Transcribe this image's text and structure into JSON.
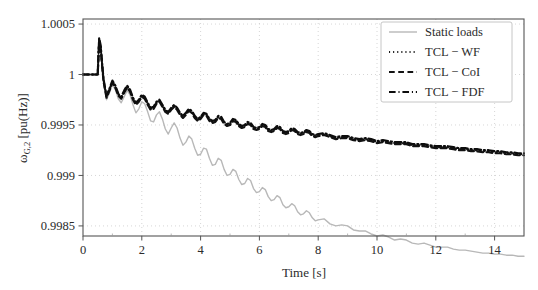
{
  "chart_data": {
    "type": "line",
    "title": "",
    "xlabel": "Time [s]",
    "ylabel": "ω_{G,2} [pu(Hz)]",
    "ylabel_main": "ω",
    "ylabel_sub": "G,2",
    "ylabel_unit": "[pu(Hz)]",
    "xlim": [
      0,
      15
    ],
    "ylim": [
      0.9984,
      1.00055
    ],
    "xticks": [
      0,
      2,
      4,
      6,
      8,
      10,
      12,
      14
    ],
    "xticklabels": [
      "0",
      "2",
      "4",
      "6",
      "8",
      "10",
      "12",
      "14"
    ],
    "yticks": [
      1.0005,
      1,
      0.9995,
      0.999,
      0.9985
    ],
    "yticklabels": [
      "1.0005",
      "1",
      "0.9995",
      "0.999",
      "0.9985"
    ],
    "grid": true,
    "grid_style": "dotted",
    "legend_position": "top-right",
    "legend": [
      "Static loads",
      "TCL − WF",
      "TCL − CoI",
      "TCL − FDF"
    ],
    "series": [
      {
        "name": "Static loads",
        "color": "#b8b8b8",
        "dash": "solid",
        "width": 1.4,
        "x": [
          0,
          0.1,
          0.2,
          0.3,
          0.4,
          0.5,
          0.55,
          0.6,
          0.65,
          0.7,
          0.8,
          0.9,
          1.0,
          1.1,
          1.2,
          1.3,
          1.4,
          1.5,
          1.6,
          1.7,
          1.8,
          1.9,
          2.0,
          2.1,
          2.2,
          2.3,
          2.4,
          2.5,
          2.6,
          2.7,
          2.8,
          2.9,
          3.0,
          3.1,
          3.2,
          3.3,
          3.4,
          3.5,
          3.6,
          3.7,
          3.8,
          3.9,
          4.0,
          4.1,
          4.2,
          4.3,
          4.4,
          4.5,
          4.6,
          4.7,
          4.8,
          4.9,
          5.0,
          5.1,
          5.2,
          5.3,
          5.4,
          5.5,
          5.6,
          5.7,
          5.8,
          5.9,
          6.0,
          6.1,
          6.2,
          6.3,
          6.4,
          6.5,
          6.6,
          6.7,
          6.8,
          6.9,
          7.0,
          7.1,
          7.2,
          7.3,
          7.4,
          7.5,
          7.6,
          7.7,
          7.8,
          7.9,
          8.0,
          8.2,
          8.4,
          8.6,
          8.8,
          9.0,
          9.2,
          9.4,
          9.6,
          9.8,
          10.0,
          10.2,
          10.4,
          10.6,
          10.8,
          11.0,
          11.2,
          11.4,
          11.6,
          11.8,
          12.0,
          12.2,
          12.4,
          12.6,
          12.8,
          13.0,
          13.2,
          13.4,
          13.6,
          13.8,
          14.0,
          14.2,
          14.4,
          14.6,
          14.8,
          15.0
        ],
        "y": [
          1.0,
          1.0,
          1.0,
          1.0,
          1.0,
          1.0,
          1.00033,
          1.00026,
          1.00008,
          0.99992,
          0.99975,
          0.99982,
          0.9999,
          0.99985,
          0.99976,
          0.99972,
          0.99978,
          0.99984,
          0.9998,
          0.9997,
          0.99962,
          0.99966,
          0.99973,
          0.99971,
          0.99963,
          0.99954,
          0.99953,
          0.9996,
          0.99963,
          0.99956,
          0.99946,
          0.99941,
          0.99947,
          0.99952,
          0.99947,
          0.99937,
          0.9993,
          0.99933,
          0.99939,
          0.99936,
          0.99927,
          0.9992,
          0.99921,
          0.99927,
          0.99926,
          0.99917,
          0.9991,
          0.99911,
          0.99917,
          0.99915,
          0.99906,
          0.999,
          0.99901,
          0.99906,
          0.99904,
          0.99896,
          0.99891,
          0.99892,
          0.99897,
          0.99895,
          0.99887,
          0.99883,
          0.99884,
          0.99888,
          0.99886,
          0.99879,
          0.99875,
          0.99876,
          0.9988,
          0.99878,
          0.99871,
          0.99868,
          0.99869,
          0.99872,
          0.9987,
          0.99864,
          0.99861,
          0.99862,
          0.99865,
          0.99863,
          0.99858,
          0.99855,
          0.99856,
          0.99857,
          0.99852,
          0.9985,
          0.99851,
          0.9985,
          0.99846,
          0.99845,
          0.99845,
          0.99842,
          0.9984,
          0.99841,
          0.99839,
          0.99836,
          0.99837,
          0.99836,
          0.99833,
          0.99832,
          0.99833,
          0.99831,
          0.99829,
          0.99829,
          0.99829,
          0.99827,
          0.99826,
          0.99826,
          0.99825,
          0.99824,
          0.99823,
          0.99823,
          0.99822,
          0.99822,
          0.99821,
          0.99821,
          0.9982,
          0.9982
        ]
      },
      {
        "name": "TCL − WF",
        "color": "#1a1a1a",
        "dash": "dotted",
        "width": 2.0,
        "x": [
          0,
          0.1,
          0.2,
          0.3,
          0.4,
          0.5,
          0.55,
          0.6,
          0.65,
          0.7,
          0.8,
          0.9,
          1.0,
          1.1,
          1.2,
          1.3,
          1.4,
          1.5,
          1.6,
          1.7,
          1.8,
          1.9,
          2.0,
          2.1,
          2.2,
          2.3,
          2.4,
          2.5,
          2.6,
          2.7,
          2.8,
          2.9,
          3.0,
          3.1,
          3.2,
          3.3,
          3.4,
          3.5,
          3.6,
          3.7,
          3.8,
          3.9,
          4.0,
          4.1,
          4.2,
          4.3,
          4.4,
          4.5,
          4.6,
          4.7,
          4.8,
          4.9,
          5.0,
          5.1,
          5.2,
          5.3,
          5.4,
          5.5,
          5.6,
          5.7,
          5.8,
          5.9,
          6.0,
          6.1,
          6.2,
          6.3,
          6.4,
          6.5,
          6.6,
          6.7,
          6.8,
          6.9,
          7.0,
          7.1,
          7.2,
          7.3,
          7.4,
          7.5,
          7.6,
          7.7,
          7.8,
          7.9,
          8.0,
          8.2,
          8.4,
          8.6,
          8.8,
          9.0,
          9.2,
          9.4,
          9.6,
          9.8,
          10.0,
          10.2,
          10.4,
          10.6,
          10.8,
          11.0,
          11.2,
          11.4,
          11.6,
          11.8,
          12.0,
          12.2,
          12.4,
          12.6,
          12.8,
          13.0,
          13.2,
          13.4,
          13.6,
          13.8,
          14.0,
          14.2,
          14.4,
          14.6,
          14.8,
          15.0
        ],
        "y": [
          1.0,
          1.0,
          1.0,
          1.0,
          1.0,
          1.0,
          1.00035,
          1.00028,
          1.0001,
          0.99994,
          0.99978,
          0.99985,
          0.99993,
          0.99988,
          0.9998,
          0.99977,
          0.99983,
          0.99988,
          0.99984,
          0.99976,
          0.99971,
          0.99974,
          0.99979,
          0.99977,
          0.99971,
          0.99966,
          0.99967,
          0.99972,
          0.99974,
          0.99969,
          0.99964,
          0.99962,
          0.99966,
          0.99969,
          0.99966,
          0.99961,
          0.99958,
          0.99961,
          0.99965,
          0.99963,
          0.99958,
          0.99955,
          0.99957,
          0.99961,
          0.9996,
          0.99955,
          0.99953,
          0.99954,
          0.99958,
          0.99957,
          0.99952,
          0.9995,
          0.99951,
          0.99955,
          0.99954,
          0.9995,
          0.99948,
          0.99949,
          0.99952,
          0.99951,
          0.99947,
          0.99946,
          0.99947,
          0.9995,
          0.99949,
          0.99945,
          0.99944,
          0.99945,
          0.99948,
          0.99947,
          0.99943,
          0.99942,
          0.99943,
          0.99946,
          0.99945,
          0.99942,
          0.99941,
          0.99942,
          0.99944,
          0.99943,
          0.9994,
          0.99939,
          0.9994,
          0.99941,
          0.99939,
          0.99937,
          0.99938,
          0.99938,
          0.99936,
          0.99935,
          0.99936,
          0.99935,
          0.99933,
          0.99934,
          0.99933,
          0.99932,
          0.99932,
          0.99932,
          0.9993,
          0.9993,
          0.9993,
          0.99929,
          0.99928,
          0.99928,
          0.99928,
          0.99927,
          0.99926,
          0.99926,
          0.99925,
          0.99925,
          0.99924,
          0.99924,
          0.99923,
          0.99923,
          0.99922,
          0.99922,
          0.99921,
          0.99921
        ]
      },
      {
        "name": "TCL − CoI",
        "color": "#121212",
        "dash": "dashed",
        "width": 2.2,
        "x": [
          0,
          0.1,
          0.2,
          0.3,
          0.4,
          0.5,
          0.55,
          0.6,
          0.65,
          0.7,
          0.8,
          0.9,
          1.0,
          1.1,
          1.2,
          1.3,
          1.4,
          1.5,
          1.6,
          1.7,
          1.8,
          1.9,
          2.0,
          2.1,
          2.2,
          2.3,
          2.4,
          2.5,
          2.6,
          2.7,
          2.8,
          2.9,
          3.0,
          3.1,
          3.2,
          3.3,
          3.4,
          3.5,
          3.6,
          3.7,
          3.8,
          3.9,
          4.0,
          4.1,
          4.2,
          4.3,
          4.4,
          4.5,
          4.6,
          4.7,
          4.8,
          4.9,
          5.0,
          5.1,
          5.2,
          5.3,
          5.4,
          5.5,
          5.6,
          5.7,
          5.8,
          5.9,
          6.0,
          6.1,
          6.2,
          6.3,
          6.4,
          6.5,
          6.6,
          6.7,
          6.8,
          6.9,
          7.0,
          7.1,
          7.2,
          7.3,
          7.4,
          7.5,
          7.6,
          7.7,
          7.8,
          7.9,
          8.0,
          8.2,
          8.4,
          8.6,
          8.8,
          9.0,
          9.2,
          9.4,
          9.6,
          9.8,
          10.0,
          10.2,
          10.4,
          10.6,
          10.8,
          11.0,
          11.2,
          11.4,
          11.6,
          11.8,
          12.0,
          12.2,
          12.4,
          12.6,
          12.8,
          13.0,
          13.2,
          13.4,
          13.6,
          13.8,
          14.0,
          14.2,
          14.4,
          14.6,
          14.8,
          15.0
        ],
        "y": [
          1.0,
          1.0,
          1.0,
          1.0,
          1.0,
          1.0,
          1.00034,
          1.00027,
          1.00009,
          0.99993,
          0.99977,
          0.99984,
          0.99992,
          0.99987,
          0.99979,
          0.99976,
          0.99982,
          0.99987,
          0.99983,
          0.99975,
          0.9997,
          0.99973,
          0.99978,
          0.99976,
          0.9997,
          0.99965,
          0.99966,
          0.99971,
          0.99973,
          0.99968,
          0.99963,
          0.99961,
          0.99965,
          0.99968,
          0.99965,
          0.9996,
          0.99957,
          0.9996,
          0.99964,
          0.99962,
          0.99957,
          0.99954,
          0.99956,
          0.9996,
          0.99959,
          0.99954,
          0.99952,
          0.99953,
          0.99957,
          0.99956,
          0.99951,
          0.99949,
          0.9995,
          0.99954,
          0.99953,
          0.99949,
          0.99947,
          0.99948,
          0.99951,
          0.9995,
          0.99946,
          0.99945,
          0.99946,
          0.99949,
          0.99948,
          0.99944,
          0.99943,
          0.99944,
          0.99947,
          0.99946,
          0.99942,
          0.99941,
          0.99942,
          0.99945,
          0.99944,
          0.99941,
          0.9994,
          0.99941,
          0.99943,
          0.99942,
          0.99939,
          0.99938,
          0.99939,
          0.9994,
          0.99938,
          0.99936,
          0.99937,
          0.99937,
          0.99935,
          0.99934,
          0.99935,
          0.99934,
          0.99932,
          0.99933,
          0.99932,
          0.99931,
          0.99931,
          0.99931,
          0.99929,
          0.99929,
          0.99929,
          0.99928,
          0.99927,
          0.99927,
          0.99927,
          0.99926,
          0.99925,
          0.99925,
          0.99924,
          0.99924,
          0.99923,
          0.99923,
          0.99922,
          0.99922,
          0.99921,
          0.99921,
          0.9992,
          0.9992
        ]
      },
      {
        "name": "TCL − FDF",
        "color": "#0d0d0d",
        "dash": "dashdot",
        "width": 2.2,
        "x": [
          0,
          0.1,
          0.2,
          0.3,
          0.4,
          0.5,
          0.55,
          0.6,
          0.65,
          0.7,
          0.8,
          0.9,
          1.0,
          1.1,
          1.2,
          1.3,
          1.4,
          1.5,
          1.6,
          1.7,
          1.8,
          1.9,
          2.0,
          2.1,
          2.2,
          2.3,
          2.4,
          2.5,
          2.6,
          2.7,
          2.8,
          2.9,
          3.0,
          3.1,
          3.2,
          3.3,
          3.4,
          3.5,
          3.6,
          3.7,
          3.8,
          3.9,
          4.0,
          4.1,
          4.2,
          4.3,
          4.4,
          4.5,
          4.6,
          4.7,
          4.8,
          4.9,
          5.0,
          5.1,
          5.2,
          5.3,
          5.4,
          5.5,
          5.6,
          5.7,
          5.8,
          5.9,
          6.0,
          6.1,
          6.2,
          6.3,
          6.4,
          6.5,
          6.6,
          6.7,
          6.8,
          6.9,
          7.0,
          7.1,
          7.2,
          7.3,
          7.4,
          7.5,
          7.6,
          7.7,
          7.8,
          7.9,
          8.0,
          8.2,
          8.4,
          8.6,
          8.8,
          9.0,
          9.2,
          9.4,
          9.6,
          9.8,
          10.0,
          10.2,
          10.4,
          10.6,
          10.8,
          11.0,
          11.2,
          11.4,
          11.6,
          11.8,
          12.0,
          12.2,
          12.4,
          12.6,
          12.8,
          13.0,
          13.2,
          13.4,
          13.6,
          13.8,
          14.0,
          14.2,
          14.4,
          14.6,
          14.8,
          15.0
        ],
        "y": [
          1.0,
          1.0,
          1.0,
          1.0,
          1.0,
          1.0,
          1.00036,
          1.00029,
          1.00011,
          0.99995,
          0.99979,
          0.99986,
          0.99994,
          0.99989,
          0.99981,
          0.99978,
          0.99984,
          0.99989,
          0.99985,
          0.99977,
          0.99972,
          0.99975,
          0.9998,
          0.99978,
          0.99972,
          0.99967,
          0.99968,
          0.99973,
          0.99975,
          0.9997,
          0.99965,
          0.99963,
          0.99967,
          0.9997,
          0.99967,
          0.99962,
          0.99959,
          0.99962,
          0.99966,
          0.99964,
          0.99959,
          0.99956,
          0.99958,
          0.99962,
          0.99961,
          0.99956,
          0.99954,
          0.99955,
          0.99959,
          0.99958,
          0.99953,
          0.99951,
          0.99952,
          0.99956,
          0.99955,
          0.99951,
          0.99949,
          0.9995,
          0.99953,
          0.99952,
          0.99948,
          0.99947,
          0.99948,
          0.99951,
          0.9995,
          0.99946,
          0.99945,
          0.99946,
          0.99949,
          0.99948,
          0.99944,
          0.99943,
          0.99944,
          0.99947,
          0.99946,
          0.99943,
          0.99942,
          0.99943,
          0.99945,
          0.99944,
          0.99941,
          0.9994,
          0.99941,
          0.99942,
          0.9994,
          0.99938,
          0.99939,
          0.99939,
          0.99937,
          0.99936,
          0.99937,
          0.99936,
          0.99934,
          0.99935,
          0.99934,
          0.99933,
          0.99933,
          0.99933,
          0.99931,
          0.99931,
          0.99931,
          0.9993,
          0.99929,
          0.99929,
          0.99929,
          0.99928,
          0.99927,
          0.99927,
          0.99926,
          0.99926,
          0.99925,
          0.99925,
          0.99924,
          0.99924,
          0.99923,
          0.99923,
          0.99922,
          0.99922
        ]
      }
    ]
  },
  "figure": {
    "background": "#ffffff",
    "axis_color": "#555555",
    "grid_color": "#cccccc"
  }
}
